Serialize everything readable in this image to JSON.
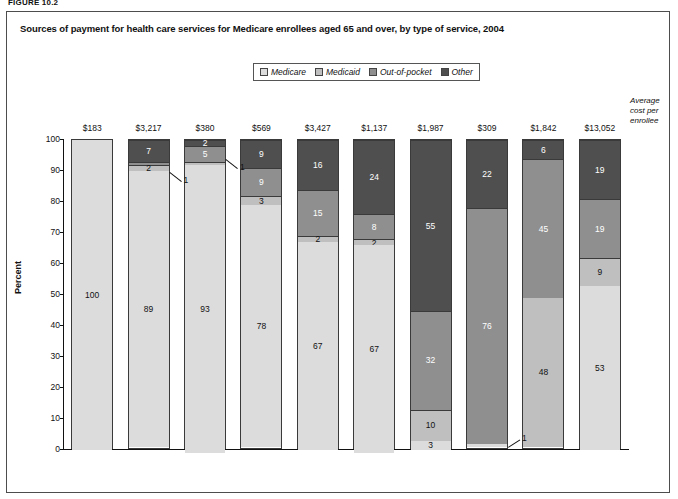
{
  "figure_label": "FIGURE 10.2",
  "title": "Sources of payment for health care services for Medicare enrollees aged 65 and over, by type of service, 2004",
  "legend": {
    "items": [
      {
        "label": "Medicare",
        "color": "#dcdcdc"
      },
      {
        "label": "Medicaid",
        "color": "#bfbfbf"
      },
      {
        "label": "Out-of-pocket",
        "color": "#8f8f8f"
      },
      {
        "label": "Other",
        "color": "#4f4f4f"
      }
    ]
  },
  "avg_note": "Average cost per enrollee",
  "axis": {
    "ylabel": "Percent",
    "yticks": [
      "0",
      "10",
      "20",
      "30",
      "40",
      "50",
      "60",
      "70",
      "80",
      "90",
      "100"
    ],
    "ymin": 0,
    "ymax": 100
  },
  "callouts": [
    {
      "text": "1",
      "series": "Out-of-pocket",
      "category": "Inpatient hospital"
    },
    {
      "text": "1",
      "series": "Medicaid",
      "category": "Home health care"
    },
    {
      "text": "1",
      "series": "Medicare",
      "category": "Dental"
    }
  ],
  "chart_data": {
    "type": "bar",
    "subtype": "stacked-100-percent",
    "title": "Sources of payment for health care services for Medicare enrollees aged 65 and over, by type of service, 2004",
    "xlabel": "",
    "ylabel": "Percent",
    "ylim": [
      0,
      100
    ],
    "grid": false,
    "legend_position": "top-center",
    "categories": [
      "Hospice",
      "Inpatient hospital",
      "Home health care",
      "Short-term institution",
      "Physican/ medical",
      "Out-patient hospital",
      "Prescription drugs",
      "Dental",
      "Long-term care facility",
      "All"
    ],
    "category_labels": [
      [
        "Hospice"
      ],
      [
        "Inpatient",
        "hospital"
      ],
      [
        "Home",
        "health",
        "care"
      ],
      [
        "Short-",
        "term",
        "institution"
      ],
      [
        "Physican/",
        "medical"
      ],
      [
        "Out-",
        "patient",
        "hospital"
      ],
      [
        "Prescription",
        "drugs"
      ],
      [
        "Dental"
      ],
      [
        "Long-term",
        "care facility"
      ],
      [
        "All"
      ]
    ],
    "average_cost_per_enrollee": [
      "$183",
      "$3,217",
      "$380",
      "$569",
      "$3,427",
      "$1,137",
      "$1,987",
      "$309",
      "$1,842",
      "$13,052"
    ],
    "series": [
      {
        "name": "Medicare",
        "color": "#dcdcdc",
        "values": [
          100,
          89,
          93,
          78,
          67,
          67,
          3,
          1,
          0,
          53
        ]
      },
      {
        "name": "Medicaid",
        "color": "#bfbfbf",
        "values": [
          0,
          2,
          1,
          3,
          2,
          2,
          10,
          0,
          48,
          9
        ]
      },
      {
        "name": "Out-of-pocket",
        "color": "#8f8f8f",
        "values": [
          0,
          1,
          5,
          9,
          15,
          8,
          32,
          76,
          45,
          19
        ]
      },
      {
        "name": "Other",
        "color": "#4f4f4f",
        "values": [
          0,
          7,
          2,
          9,
          16,
          24,
          55,
          22,
          6,
          19
        ]
      }
    ],
    "label_visibility": {
      "Medicare": [
        true,
        true,
        true,
        true,
        true,
        true,
        true,
        false,
        false,
        true
      ],
      "Medicaid": [
        false,
        true,
        false,
        true,
        true,
        true,
        true,
        false,
        true,
        true
      ],
      "Out-of-pocket": [
        false,
        false,
        true,
        true,
        true,
        true,
        true,
        true,
        true,
        true
      ],
      "Other": [
        false,
        true,
        true,
        true,
        true,
        true,
        true,
        true,
        true,
        true
      ]
    }
  }
}
